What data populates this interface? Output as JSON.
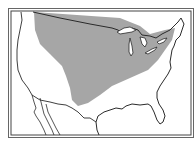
{
  "map": {
    "type": "range-map",
    "region": "contiguous United States",
    "style": "black-and-white outline map with double-line frame",
    "shaded_region": {
      "description": "Northern Great Plains to Great Lakes and southern Ontario/Quebec border region",
      "fill_color": "#a6a6a6"
    },
    "colors": {
      "background": "#ffffff",
      "outline": "#2a2a2a",
      "frame": "#555555",
      "shading": "#a6a6a6"
    },
    "features": [
      "US outline",
      "Canada border",
      "Mexico border",
      "Great Lakes",
      "Florida peninsula",
      "Baja California"
    ]
  }
}
